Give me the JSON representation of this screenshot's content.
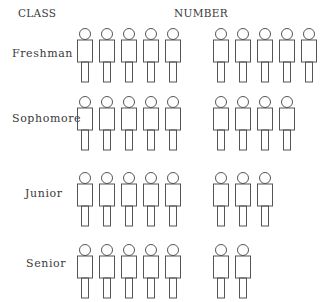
{
  "headers": {
    "class_label": "CLASS",
    "number_label": "NUMBER"
  },
  "rows": [
    {
      "label": "Freshman",
      "count": 10
    },
    {
      "label": "Sophomore",
      "count": 9
    },
    {
      "label": "Junior",
      "count": 8
    },
    {
      "label": "Senior",
      "count": 7
    }
  ],
  "icon": "person-icon",
  "colors": {
    "stroke": "#555555",
    "text": "#3a3a3a",
    "background": "#ffffff"
  },
  "chart_data": {
    "type": "pictograph",
    "title": "",
    "xlabel": "NUMBER",
    "ylabel": "CLASS",
    "categories": [
      "Freshman",
      "Sophomore",
      "Junior",
      "Senior"
    ],
    "values": [
      10,
      9,
      8,
      7
    ],
    "icon": "person",
    "icon_grouping": 5,
    "legend": []
  }
}
